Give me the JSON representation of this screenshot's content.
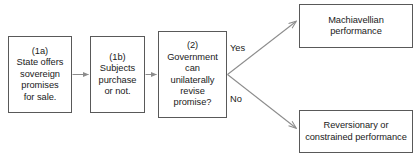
{
  "diagram": {
    "type": "flowchart",
    "orientation": "left-to-right",
    "background_color": "#ffffff",
    "line_color": "#808080",
    "box_border_color": "#595959",
    "text_color": "#1a1a1a",
    "nodes": [
      {
        "id": "state-offers",
        "step_label": "(1a)",
        "text": "(1a)\nState offers\nsovereign\npromises\nfor sale.",
        "shape": "rectangle"
      },
      {
        "id": "subjects",
        "step_label": "(1b)",
        "text": "(1b)\nSubjects\npurchase\nor not.",
        "shape": "rectangle"
      },
      {
        "id": "government",
        "step_label": "(2)",
        "text": "(2)\nGovernment\ncan\nunilaterally\nrevise\npromise?",
        "shape": "rectangle"
      },
      {
        "id": "machiavellian",
        "step_label": "",
        "text": "Machiavellian\nperformance",
        "shape": "rectangle"
      },
      {
        "id": "reversionary",
        "step_label": "",
        "text": "Reversionary or\nconstrained performance",
        "shape": "rectangle"
      }
    ],
    "edges": [
      {
        "id": "edge-1a-1b",
        "from": "state-offers",
        "to": "subjects",
        "label": ""
      },
      {
        "id": "edge-1b-2",
        "from": "subjects",
        "to": "government",
        "label": ""
      },
      {
        "id": "edge-yes",
        "from": "government",
        "to": "machiavellian",
        "label": "Yes"
      },
      {
        "id": "edge-no",
        "from": "government",
        "to": "reversionary",
        "label": "No"
      }
    ],
    "branch_labels": {
      "yes": "Yes",
      "no": "No"
    }
  }
}
